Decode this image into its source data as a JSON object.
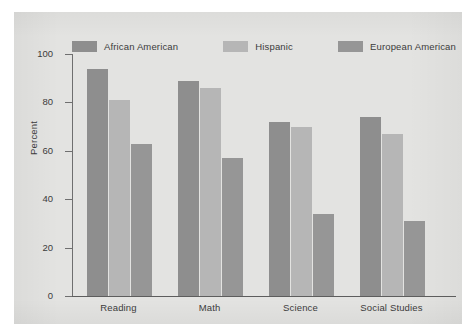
{
  "chart_data": {
    "type": "bar",
    "title": "",
    "xlabel": "",
    "ylabel": "Percent",
    "ylim": [
      0,
      100
    ],
    "yticks": [
      0,
      20,
      40,
      60,
      80,
      100
    ],
    "grid": false,
    "legend_position": "top",
    "categories": [
      "Reading",
      "Math",
      "Science",
      "Social Studies"
    ],
    "series": [
      {
        "name": "African American",
        "color": "#8e8e8e",
        "values": [
          94,
          89,
          72,
          74
        ]
      },
      {
        "name": "Hispanic",
        "color": "#b6b6b6",
        "values": [
          81,
          86,
          70,
          67
        ]
      },
      {
        "name": "European American",
        "color": "#969696",
        "values": [
          63,
          57,
          34,
          31
        ]
      }
    ]
  },
  "axis": {
    "y_title": "Percent",
    "y_tick_labels": [
      "100",
      "80",
      "60",
      "40",
      "20",
      "0"
    ],
    "x_tick_labels": [
      "Reading",
      "Math",
      "Science",
      "Social Studies"
    ]
  },
  "legend": {
    "items": [
      {
        "label": "African American",
        "color": "#8e8e8e"
      },
      {
        "label": "Hispanic",
        "color": "#b6b6b6"
      },
      {
        "label": "European American",
        "color": "#969696"
      }
    ]
  },
  "colors": {
    "page_background": "#ffffff",
    "plate_background": "#e3e3e1",
    "axis": "#6f6f6f",
    "text": "#3b3b3b"
  }
}
